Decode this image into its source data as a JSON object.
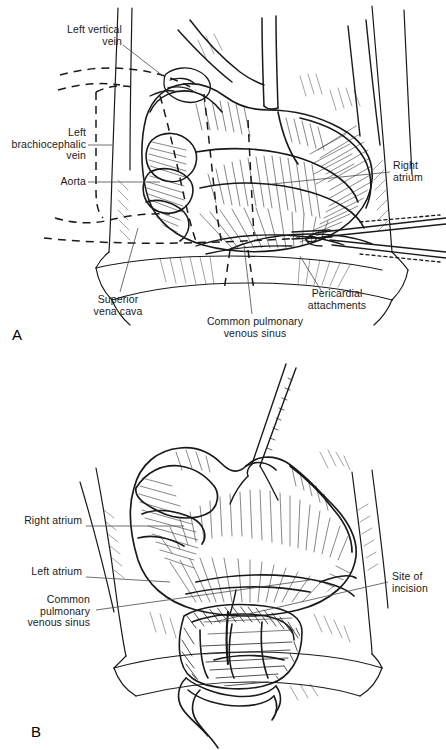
{
  "figure": {
    "type": "medical-surgical-illustration",
    "style": "black-and-white pen-and-ink line drawing",
    "background_color": "#ffffff",
    "ink_color": "#1a1a1a",
    "panel_count": 2
  },
  "panel_a": {
    "letter": "A",
    "scene": "Anterior operative view of the heart within the opened pericardium; the heart is retracted to expose the common pulmonary venous sinus behind the left atrium. Surgical forceps enter from the right. Dashed lines indicate structures hidden behind the heart.",
    "labels": [
      {
        "id": "left-vertical-vein",
        "text": "Left vertical\nvein",
        "align": "right"
      },
      {
        "id": "left-brachiocephalic-vein",
        "text": "Left\nbrachiocephalic\nvein",
        "align": "right"
      },
      {
        "id": "aorta",
        "text": "Aorta",
        "align": "right"
      },
      {
        "id": "right-atrium",
        "text": "Right\natrium",
        "align": "left"
      },
      {
        "id": "superior-vena-cava",
        "text": "Superior\nvena cava",
        "align": "center"
      },
      {
        "id": "common-pulmonary-venous-sinus",
        "text": "Common pulmonary\nvenous sinus",
        "align": "center"
      },
      {
        "id": "pericardial-attachments",
        "text": "Pericardial\nattachments",
        "align": "center"
      }
    ]
  },
  "panel_b": {
    "letter": "B",
    "scene": "Closer anterior view with the heart lifted by a traction stitch at the apex; the common pulmonary venous sinus has been opened, showing the planned site of incision across the left atrium and venous sinus.",
    "labels": [
      {
        "id": "right-atrium",
        "text": "Right atrium",
        "align": "right"
      },
      {
        "id": "left-atrium",
        "text": "Left atrium",
        "align": "right"
      },
      {
        "id": "common-pulmonary-venous-sinus",
        "text": "Common\npulmonary\nvenous sinus",
        "align": "right"
      },
      {
        "id": "site-of-incision",
        "text": "Site of\nincision",
        "align": "left"
      }
    ]
  }
}
